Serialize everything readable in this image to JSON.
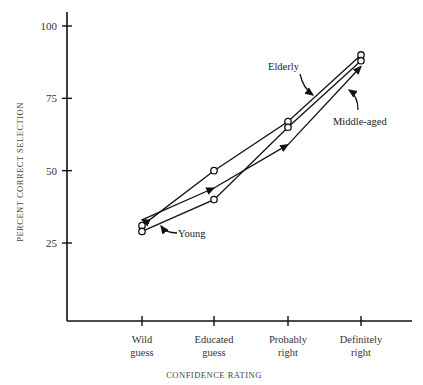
{
  "chart_data": {
    "type": "line",
    "title": "",
    "xlabel": "CONFIDENCE RATING",
    "ylabel": "PERCENT CORRECT SELECTION",
    "categories": [
      "Wild guess",
      "Educated guess",
      "Probably right",
      "Definitely right"
    ],
    "category_lines": [
      [
        "Wild",
        "guess"
      ],
      [
        "Educated",
        "guess"
      ],
      [
        "Probably",
        "right"
      ],
      [
        "Definitely",
        "right"
      ]
    ],
    "yticks": [
      25,
      50,
      75,
      100
    ],
    "ylim": [
      0,
      105
    ],
    "grid": false,
    "legend": "inline annotations",
    "series": [
      {
        "name": "Elderly",
        "marker": "open-circle",
        "values": [
          31,
          50,
          67,
          90
        ]
      },
      {
        "name": "Middle-aged",
        "marker": "arrow",
        "values": [
          33,
          44,
          59,
          86
        ]
      },
      {
        "name": "Young",
        "marker": "open-circle",
        "values": [
          29,
          40,
          65,
          88
        ]
      }
    ],
    "annotations": [
      "Elderly",
      "Middle-aged",
      "Young"
    ]
  }
}
